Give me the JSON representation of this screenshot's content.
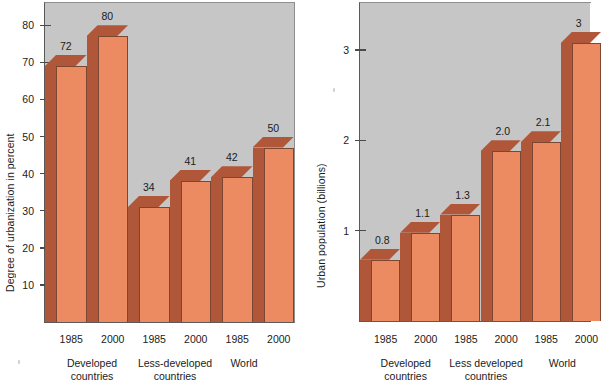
{
  "figure": {
    "background": "#ffffff",
    "plot_background": "#c6c6c6",
    "bar_front_color": "#ec8a62",
    "bar_side_color": "#b0573a",
    "bar_outline_color": "#7d4630",
    "axis_color": "#4a4a4a"
  },
  "chart_data": [
    {
      "id": "urbanization-degree",
      "type": "bar",
      "title": "",
      "xlabel": "",
      "ylabel": "Degree of urbanization in percent",
      "ylim": [
        0,
        86
      ],
      "yticks": [
        10,
        20,
        30,
        40,
        50,
        60,
        70,
        80
      ],
      "ytick_labels": [
        "10",
        "20",
        "30",
        "40",
        "50",
        "60",
        "70",
        "80"
      ],
      "grid": false,
      "legend": "none",
      "categories": [
        "1985",
        "2000",
        "1985",
        "2000",
        "1985",
        "2000"
      ],
      "values": [
        72,
        80,
        34,
        41,
        42,
        50
      ],
      "data_labels": [
        "72",
        "80",
        "34",
        "41",
        "42",
        "50"
      ],
      "groups": [
        {
          "label_line1": "Developed",
          "label_line2": "countries",
          "span": [
            0,
            1
          ]
        },
        {
          "label_line1": "Less-developed",
          "label_line2": "countries",
          "span": [
            2,
            3
          ]
        },
        {
          "label_line1": "World",
          "label_line2": "",
          "span": [
            4,
            5
          ]
        }
      ]
    },
    {
      "id": "urban-population",
      "type": "bar",
      "title": "",
      "xlabel": "",
      "ylabel": "Urban population (billions)",
      "ylim": [
        0,
        3.52
      ],
      "yticks": [
        1,
        2,
        3
      ],
      "ytick_labels": [
        "1",
        "2",
        "3"
      ],
      "grid": false,
      "legend": "none",
      "categories": [
        "1985",
        "2000",
        "1985",
        "2000",
        "1985",
        "2000"
      ],
      "values": [
        0.8,
        1.1,
        1.3,
        2.0,
        2.1,
        3.2
      ],
      "data_labels": [
        "0.8",
        "1.1",
        "1.3",
        "2.0",
        "2.1",
        "3"
      ],
      "groups": [
        {
          "label_line1": "Developed",
          "label_line2": "countries",
          "span": [
            0,
            1
          ]
        },
        {
          "label_line1": "Less developed",
          "label_line2": "countries",
          "span": [
            2,
            3
          ]
        },
        {
          "label_line1": "World",
          "label_line2": "",
          "span": [
            4,
            5
          ]
        }
      ]
    }
  ],
  "left_chart": {
    "ylabel": "Degree of urbanization in percent",
    "yticks": [
      {
        "label": "80"
      },
      {
        "label": "70"
      },
      {
        "label": "60"
      },
      {
        "label": "50"
      },
      {
        "label": "40"
      },
      {
        "label": "30"
      },
      {
        "label": "20"
      },
      {
        "label": "10"
      }
    ],
    "bars": [
      {
        "value_label": "72",
        "xtick": "1985"
      },
      {
        "value_label": "80",
        "xtick": "2000"
      },
      {
        "value_label": "34",
        "xtick": "1985"
      },
      {
        "value_label": "41",
        "xtick": "2000"
      },
      {
        "value_label": "42",
        "xtick": "1985"
      },
      {
        "value_label": "50",
        "xtick": "2000"
      }
    ],
    "groups": [
      {
        "line1": "Developed",
        "line2": "countries"
      },
      {
        "line1": "Less-developed",
        "line2": "countries"
      },
      {
        "line1": "World",
        "line2": ""
      }
    ]
  },
  "right_chart": {
    "ylabel": "Urban population (billions)",
    "yticks": [
      {
        "label": "3"
      },
      {
        "label": "2"
      },
      {
        "label": "1"
      }
    ],
    "bars": [
      {
        "value_label": "0.8",
        "xtick": "1985"
      },
      {
        "value_label": "1.1",
        "xtick": "2000"
      },
      {
        "value_label": "1.3",
        "xtick": "1985"
      },
      {
        "value_label": "2.0",
        "xtick": "2000"
      },
      {
        "value_label": "2.1",
        "xtick": "1985"
      },
      {
        "value_label": "3",
        "xtick": "2"
      }
    ],
    "groups": [
      {
        "line1": "Developed",
        "line2": "countries"
      },
      {
        "line1": "Less developed",
        "line2": "countries"
      },
      {
        "line1": "World",
        "line2": ""
      }
    ]
  }
}
